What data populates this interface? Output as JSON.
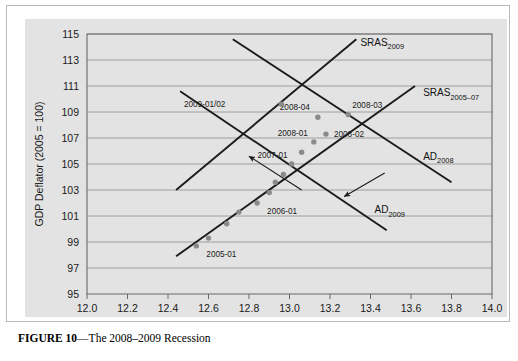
{
  "figure": {
    "caption_label": "FIGURE 10",
    "caption_dash": "—",
    "caption_text": "The 2008–2009 Recession"
  },
  "chart_data": {
    "type": "scatter",
    "title": "The 2008–2009 Recession",
    "xlabel": "Real Gross Domestic Product (trillions of 2005 dollars)",
    "ylabel": "GDP Deflator (2005 = 100)",
    "xlim": [
      12.0,
      14.0
    ],
    "ylim": [
      95,
      115
    ],
    "xticks": [
      "12.0",
      "12.2",
      "12.4",
      "12.6",
      "12.8",
      "13.0",
      "13.2",
      "13.4",
      "13.6",
      "13.8",
      "14.0"
    ],
    "yticks": [
      "95",
      "97",
      "99",
      "101",
      "103",
      "105",
      "107",
      "109",
      "111",
      "113",
      "115"
    ],
    "grid": true,
    "legend": "none",
    "point_color": "#8a8a8a",
    "line_color": "#1b1b1b",
    "panel_color": "#e3e3e3",
    "points": [
      {
        "label": "2005-01",
        "x": 12.54,
        "y": 98.7,
        "label_dx": 10,
        "label_dy": 11
      },
      {
        "label": "",
        "x": 12.6,
        "y": 99.3,
        "label_dx": 0,
        "label_dy": 0
      },
      {
        "label": "",
        "x": 12.69,
        "y": 100.4,
        "label_dx": 0,
        "label_dy": 0
      },
      {
        "label": "",
        "x": 12.75,
        "y": 101.3,
        "label_dx": 0,
        "label_dy": 0
      },
      {
        "label": "2006-01",
        "x": 12.84,
        "y": 102.0,
        "label_dx": 10,
        "label_dy": 11
      },
      {
        "label": "",
        "x": 12.9,
        "y": 102.8,
        "label_dx": 0,
        "label_dy": 0
      },
      {
        "label": "",
        "x": 12.93,
        "y": 103.6,
        "label_dx": 0,
        "label_dy": 0
      },
      {
        "label": "",
        "x": 12.97,
        "y": 104.2,
        "label_dx": 0,
        "label_dy": 0
      },
      {
        "label": "2007-01",
        "x": 13.01,
        "y": 105.0,
        "label_dx": -4,
        "label_dy": -6
      },
      {
        "label": "",
        "x": 13.06,
        "y": 105.9,
        "label_dx": 0,
        "label_dy": 0
      },
      {
        "label": "2008-01",
        "x": 13.12,
        "y": 106.7,
        "label_dx": -6,
        "label_dy": -6
      },
      {
        "label": "2008-02",
        "x": 13.18,
        "y": 107.3,
        "label_dx": 8,
        "label_dy": 3
      },
      {
        "label": "2008-04",
        "x": 13.14,
        "y": 108.6,
        "label_dx": -8,
        "label_dy": -7
      },
      {
        "label": "2008-03",
        "x": 13.29,
        "y": 108.8,
        "label_dx": 4,
        "label_dy": -7
      },
      {
        "label": "2009-01/02",
        "x": 12.96,
        "y": 109.6,
        "label_dx": -56,
        "label_dy": 3
      }
    ],
    "curves": [
      {
        "name": "SRAS_2005-07",
        "label": "SRAS",
        "sub": "2005–07",
        "x1": 12.44,
        "y1": 97.9,
        "x2": 13.62,
        "y2": 111.0,
        "label_x": 13.66,
        "label_y": 110.2
      },
      {
        "name": "SRAS_2009",
        "label": "SRAS",
        "sub": "2009",
        "x1": 12.44,
        "y1": 103.0,
        "x2": 13.33,
        "y2": 114.6,
        "label_x": 13.35,
        "label_y": 114.1
      },
      {
        "name": "AD_2008",
        "label": "AD",
        "sub": "2008",
        "x1": 12.72,
        "y1": 114.6,
        "x2": 13.8,
        "y2": 103.6,
        "label_x": 13.66,
        "label_y": 105.3
      },
      {
        "name": "AD_2009",
        "label": "AD",
        "sub": "2009",
        "x1": 12.46,
        "y1": 110.6,
        "x2": 13.48,
        "y2": 99.9,
        "label_x": 13.42,
        "label_y": 101.2
      }
    ],
    "pointers": [
      {
        "name": "sras-shift-arrow",
        "from_x": 13.06,
        "from_y": 103.0,
        "to_x": 12.8,
        "to_y": 105.6
      },
      {
        "name": "ad-shift-arrow",
        "from_x": 13.47,
        "from_y": 104.3,
        "to_x": 13.27,
        "to_y": 102.5
      }
    ]
  }
}
